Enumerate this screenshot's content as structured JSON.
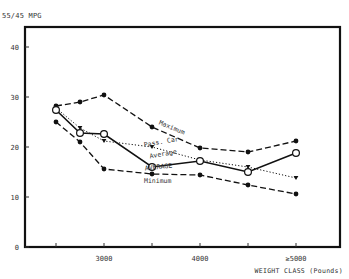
{
  "chart_data": {
    "type": "line",
    "title": "",
    "ylabel": "55/45 MPG",
    "xlabel": "WEIGHT CLASS (Pounds)",
    "ylim": [
      0,
      44
    ],
    "yticks": [
      0,
      10,
      20,
      30,
      40
    ],
    "xticks": [
      2500,
      3000,
      3500,
      4000,
      4500,
      5000
    ],
    "xtick_labels": {
      "3000": "3000",
      "4000": "4000",
      "5000": "≥5000"
    },
    "x": [
      2500,
      2750,
      3000,
      3500,
      4000,
      4500,
      5000
    ],
    "grid": false,
    "legend": "inline labels",
    "series": [
      {
        "name": "Maximum",
        "style": "dashed",
        "marker": "filled-circle",
        "values": [
          28.2,
          29.0,
          30.4,
          24.0,
          19.8,
          19.0,
          21.2
        ]
      },
      {
        "name": "Pass. Car Average",
        "style": "dotted",
        "marker": "filled-triangle",
        "values": [
          27.8,
          23.8,
          21.2,
          20.0,
          17.4,
          16.0,
          13.8
        ]
      },
      {
        "name": "AVERAGE",
        "style": "solid",
        "marker": "open-circle",
        "values": [
          27.4,
          22.8,
          22.6,
          16.0,
          17.2,
          15.0,
          18.8
        ]
      },
      {
        "name": "Minimum",
        "style": "dashed",
        "marker": "filled-circle",
        "values": [
          25.0,
          21.0,
          15.6,
          14.6,
          14.4,
          12.4,
          10.6
        ]
      }
    ],
    "annotations": [
      {
        "text": "Maximum",
        "x": 3700,
        "y": 23.5
      },
      {
        "text": "Pass. Car",
        "x": 3600,
        "y": 20.6
      },
      {
        "text": "Average",
        "x": 3620,
        "y": 18.2
      },
      {
        "text": "AVERAGE",
        "x": 3570,
        "y": 15.6
      },
      {
        "text": "Minimum",
        "x": 3560,
        "y": 12.8
      }
    ]
  },
  "axis": {
    "y_title": "55/45 MPG",
    "x_title": "WEIGHT CLASS (Pounds)"
  }
}
